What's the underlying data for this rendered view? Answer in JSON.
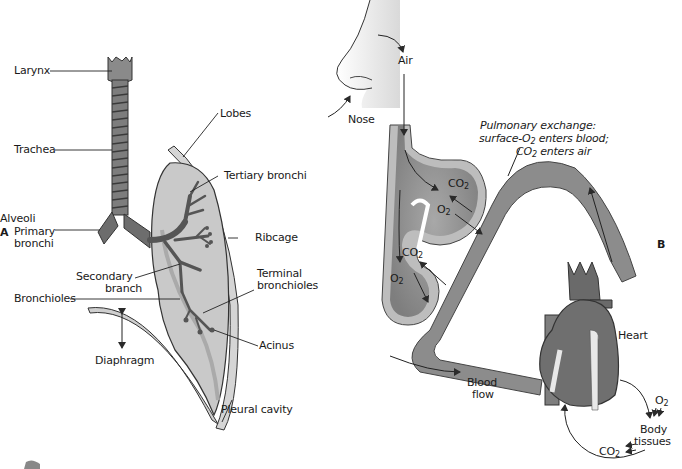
{
  "panel_a": {
    "letter": "A",
    "labels": {
      "larynx": "Larynx",
      "trachea": "Trachea",
      "primary_bronchi_1": "Primary",
      "primary_bronchi_2": "bronchi",
      "lobes": "Lobes",
      "tertiary_bronchi": "Tertiary bronchi",
      "ribcage": "Ribcage",
      "secondary_branch_1": "Secondary",
      "secondary_branch_2": "branch",
      "terminal_bronchioles_1": "Terminal",
      "terminal_bronchioles_2": "bronchioles",
      "bronchioles": "Bronchioles",
      "acinus": "Acinus",
      "diaphragm": "Diaphragm",
      "pleural_cavity": "Pleural cavity"
    }
  },
  "panel_b": {
    "letter": "B",
    "labels": {
      "nose": "Nose",
      "air": "Air",
      "alveoli": "Alveoli",
      "pulmonary_exchange_1": "Pulmonary exchange:",
      "pulmonary_exchange_2a": "surface-O",
      "pulmonary_exchange_2b": " enters blood;",
      "pulmonary_exchange_3a": "CO",
      "pulmonary_exchange_3b": " enters air",
      "heart": "Heart",
      "blood_flow_1": "Blood",
      "blood_flow_2": "flow",
      "body_tissues_1": "Body",
      "body_tissues_2": "tissues",
      "co2": "CO",
      "o2": "O",
      "sub2": "2"
    }
  },
  "colors": {
    "lung_fill": "#c9c9c9",
    "lung_dark": "#7a7a7a",
    "airway": "#5c5c5c",
    "blood_vessel": "#8c8c8c",
    "alveolus_wall": "#bdbdbd",
    "alveolus_inner": "#9a9a9a",
    "heart": "#6f6f6f",
    "line": "#2a2a2a"
  }
}
